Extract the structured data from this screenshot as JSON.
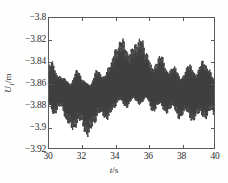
{
  "chart_data": {
    "type": "line",
    "title": "",
    "xlabel": "t/s",
    "ylabel": "U1/m",
    "xlabel_parts": {
      "symbol": "t",
      "unit": "s"
    },
    "ylabel_parts": {
      "symbol": "U",
      "subscript": "1",
      "unit": "m"
    },
    "xlim": [
      30,
      40
    ],
    "ylim": [
      -3.92,
      -3.8
    ],
    "xticks": [
      30,
      32,
      34,
      36,
      38,
      40
    ],
    "xtick_labels": [
      "30",
      "32",
      "34",
      "36",
      "38",
      "40"
    ],
    "yticks": [
      -3.8,
      -3.82,
      -3.84,
      -3.86,
      -3.88,
      -3.9,
      -3.92
    ],
    "ytick_labels": [
      "−3.8",
      "−3.82",
      "−3.84",
      "−3.86",
      "−3.88",
      "−3.9",
      "−3.92"
    ],
    "grid": false,
    "legend": null,
    "box": true,
    "tick_direction": "in",
    "series": [
      {
        "name": "U1",
        "color": "#3f3f3f",
        "linewidth": 0.5,
        "description": "Dense amplitude-modulated oscillation (beat pattern) of vertical displacement versus time",
        "mean_level": -3.8655,
        "carrier_frequency_hz": 38,
        "beat_peaks_t": [
          30.15,
          30.95,
          31.85,
          32.75,
          33.6,
          34.45,
          35.3,
          35.75,
          36.85,
          37.8,
          38.7,
          39.55
        ],
        "envelope_upper": [
          {
            "t": 30.0,
            "y": -3.8435
          },
          {
            "t": 30.2,
            "y": -3.8405
          },
          {
            "t": 30.5,
            "y": -3.853
          },
          {
            "t": 30.9,
            "y": -3.8555
          },
          {
            "t": 31.3,
            "y": -3.861
          },
          {
            "t": 31.7,
            "y": -3.848
          },
          {
            "t": 32.1,
            "y": -3.858
          },
          {
            "t": 32.5,
            "y": -3.862
          },
          {
            "t": 32.9,
            "y": -3.848
          },
          {
            "t": 33.3,
            "y": -3.8545
          },
          {
            "t": 33.7,
            "y": -3.844
          },
          {
            "t": 34.0,
            "y": -3.83
          },
          {
            "t": 34.45,
            "y": -3.8195
          },
          {
            "t": 34.8,
            "y": -3.833
          },
          {
            "t": 35.2,
            "y": -3.8255
          },
          {
            "t": 35.6,
            "y": -3.8185
          },
          {
            "t": 35.9,
            "y": -3.833
          },
          {
            "t": 36.3,
            "y": -3.846
          },
          {
            "t": 36.8,
            "y": -3.8345
          },
          {
            "t": 37.2,
            "y": -3.85
          },
          {
            "t": 37.6,
            "y": -3.845
          },
          {
            "t": 38.0,
            "y": -3.856
          },
          {
            "t": 38.5,
            "y": -3.843
          },
          {
            "t": 38.9,
            "y": -3.852
          },
          {
            "t": 39.3,
            "y": -3.84
          },
          {
            "t": 39.7,
            "y": -3.8475
          },
          {
            "t": 40.0,
            "y": -3.856
          }
        ],
        "envelope_lower": [
          {
            "t": 30.0,
            "y": -3.88
          },
          {
            "t": 30.3,
            "y": -3.8895
          },
          {
            "t": 30.7,
            "y": -3.881
          },
          {
            "t": 31.1,
            "y": -3.896
          },
          {
            "t": 31.5,
            "y": -3.903
          },
          {
            "t": 31.9,
            "y": -3.894
          },
          {
            "t": 32.3,
            "y": -3.9095
          },
          {
            "t": 32.7,
            "y": -3.8985
          },
          {
            "t": 33.1,
            "y": -3.887
          },
          {
            "t": 33.5,
            "y": -3.894
          },
          {
            "t": 33.9,
            "y": -3.884
          },
          {
            "t": 34.3,
            "y": -3.8755
          },
          {
            "t": 34.7,
            "y": -3.883
          },
          {
            "t": 35.1,
            "y": -3.874
          },
          {
            "t": 35.5,
            "y": -3.88
          },
          {
            "t": 35.9,
            "y": -3.8735
          },
          {
            "t": 36.3,
            "y": -3.887
          },
          {
            "t": 36.7,
            "y": -3.879
          },
          {
            "t": 37.1,
            "y": -3.888
          },
          {
            "t": 37.5,
            "y": -3.8815
          },
          {
            "t": 37.9,
            "y": -3.893
          },
          {
            "t": 38.3,
            "y": -3.8855
          },
          {
            "t": 38.7,
            "y": -3.8955
          },
          {
            "t": 39.1,
            "y": -3.8875
          },
          {
            "t": 39.5,
            "y": -3.893
          },
          {
            "t": 39.8,
            "y": -3.8845
          },
          {
            "t": 40.0,
            "y": -3.89
          }
        ]
      }
    ]
  }
}
